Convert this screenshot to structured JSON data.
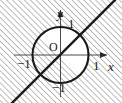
{
  "figure": {
    "width": 122,
    "height": 103,
    "background_color": "#ffffff",
    "stroke_color": "#1a1a1a",
    "hatch_color": "#808080",
    "axes": {
      "x_axis_label": "x",
      "y_axis_label": "y",
      "origin_label": "O",
      "x_ticks": [
        {
          "value": -1,
          "label": "−1"
        },
        {
          "value": 1,
          "label": "1"
        }
      ],
      "y_ticks": [
        {
          "value": 1,
          "label": "1"
        },
        {
          "value": -1,
          "label": "−1"
        }
      ],
      "x_arrow": "right",
      "y_arrow": "up"
    },
    "shapes": [
      {
        "name": "unit-circle",
        "type": "circle",
        "center": [
          0,
          0
        ],
        "radius": 1,
        "stroke": "#1a1a1a",
        "fill": "none"
      },
      {
        "name": "diagonal-line",
        "type": "line",
        "equation": "y = x",
        "slope": 1,
        "intercept": 0,
        "stroke": "#1a1a1a"
      }
    ],
    "shaded_region": {
      "name": "hatched-region",
      "description": "Everything except the part of the open unit disk lying above the line y = x",
      "hatch_angle_deg": 45,
      "hatch_spacing_px": 4,
      "hatch_color": "#9a9a9a"
    }
  }
}
